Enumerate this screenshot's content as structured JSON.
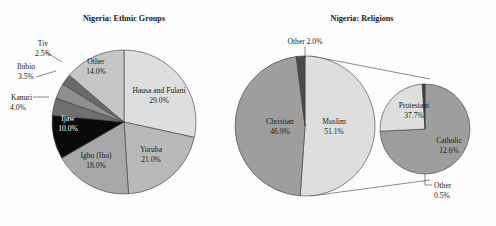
{
  "figure": {
    "background": "#fdfdfd",
    "charts": [
      {
        "id": "ethnic-groups",
        "title": "Nigeria: Ethnic Groups"
      },
      {
        "id": "religions",
        "title": "Nigeria: Religions"
      }
    ]
  },
  "chart_data": [
    {
      "type": "pie",
      "title": "Nigeria: Ethnic Groups",
      "xlabel": "",
      "ylabel": "",
      "units": "percent",
      "start_angle_deg": 0,
      "direction": "clockwise",
      "legend": "none",
      "labels_inside": true,
      "categories": [
        "Hausa and Fulani",
        "Yoruba",
        "Igbo (Ibo)",
        "Ijaw",
        "Kanuri",
        "Ibibio",
        "Tiv",
        "Other"
      ],
      "values": [
        29.0,
        21.0,
        18.0,
        10.0,
        4.0,
        3.5,
        2.5,
        14.0
      ],
      "slices": [
        {
          "name": "Hausa and Fulani",
          "value": 29.0,
          "label": "Hausa and Fulani",
          "value_label": "29.0%",
          "color": "#dedede",
          "text_color": "#1a1a1a",
          "placement": "inside"
        },
        {
          "name": "Yoruba",
          "value": 21.0,
          "label": "Yoruba",
          "value_label": "21.0%",
          "color": "#b9b9b9",
          "text_color": "#1a1a1a",
          "placement": "inside"
        },
        {
          "name": "Igbo (Ibo)",
          "value": 18.0,
          "label": "Igbo (Ibo)",
          "value_label": "18.0%",
          "color": "#a8a8a8",
          "text_color": "#1a1a1a",
          "placement": "inside"
        },
        {
          "name": "Ijaw",
          "value": 10.0,
          "label": "Ijaw",
          "value_label": "10.0%",
          "color": "#0a0a0a",
          "text_color": "#ffffff",
          "placement": "inside"
        },
        {
          "name": "Kanuri",
          "value": 4.0,
          "label": "Kanuri",
          "value_label": "4.0%",
          "color": "#6f6f6f",
          "text_color": "#1a1a1a",
          "placement": "outside-left"
        },
        {
          "name": "Ibibio",
          "value": 3.5,
          "label": "Ibibio",
          "value_label": "3.5%",
          "color": "#8f8f8f",
          "text_color": "#1a1a1a",
          "placement": "outside-left"
        },
        {
          "name": "Tiv",
          "value": 2.5,
          "label": "Tiv",
          "value_label": "2.5%",
          "color": "#6a6a6a",
          "text_color": "#1a1a1a",
          "placement": "outside-left"
        },
        {
          "name": "Other",
          "value": 14.0,
          "label": "Other",
          "value_label": "14.0%",
          "color": "#c6c6c6",
          "text_color": "#1a1a1a",
          "placement": "inside"
        }
      ]
    },
    {
      "type": "pie",
      "title": "Nigeria: Religions",
      "xlabel": "",
      "ylabel": "",
      "units": "percent",
      "start_angle_deg": 0,
      "direction": "clockwise",
      "legend": "none",
      "labels_inside": true,
      "has_breakout": true,
      "breakout_of": "Christian",
      "categories": [
        "Muslim",
        "Christian",
        "Other"
      ],
      "values": [
        51.1,
        46.9,
        2.0
      ],
      "slices": [
        {
          "name": "Muslim",
          "value": 51.1,
          "label": "Muslim",
          "value_label": "51.1%",
          "color": "#dedede",
          "text_color": "#1a1a1a",
          "placement": "inside"
        },
        {
          "name": "Christian",
          "value": 46.9,
          "label": "Christian",
          "value_label": "46.9%",
          "color": "#9e9e9e",
          "text_color": "#1a1a1a",
          "placement": "inside"
        },
        {
          "name": "Other",
          "value": 2.0,
          "label": "Other",
          "value_label": "2.0%",
          "combined_label": "Other 2.0%",
          "color": "#4a4a4a",
          "text_color": "#1a1a1a",
          "placement": "outside-top"
        }
      ],
      "breakout": {
        "title": "",
        "categories": [
          "Protestant",
          "Catholic",
          "Other"
        ],
        "values": [
          37.7,
          12.6,
          0.5
        ],
        "slices": [
          {
            "name": "Protestant",
            "value": 37.7,
            "label": "Protestant",
            "value_label": "37.7%",
            "color": "#9e9e9e",
            "text_color": "#1a1a1a",
            "placement": "inside"
          },
          {
            "name": "Catholic",
            "value": 12.6,
            "label": "Catholic",
            "value_label": "12.6%",
            "color": "#dedede",
            "text_color": "#1a1a1a",
            "placement": "inside"
          },
          {
            "name": "Other",
            "value": 0.5,
            "label": "Other",
            "value_label": "0.5%",
            "color": "#3d3d3d",
            "text_color": "#1a1a1a",
            "placement": "outside-bottom"
          }
        ]
      }
    }
  ]
}
